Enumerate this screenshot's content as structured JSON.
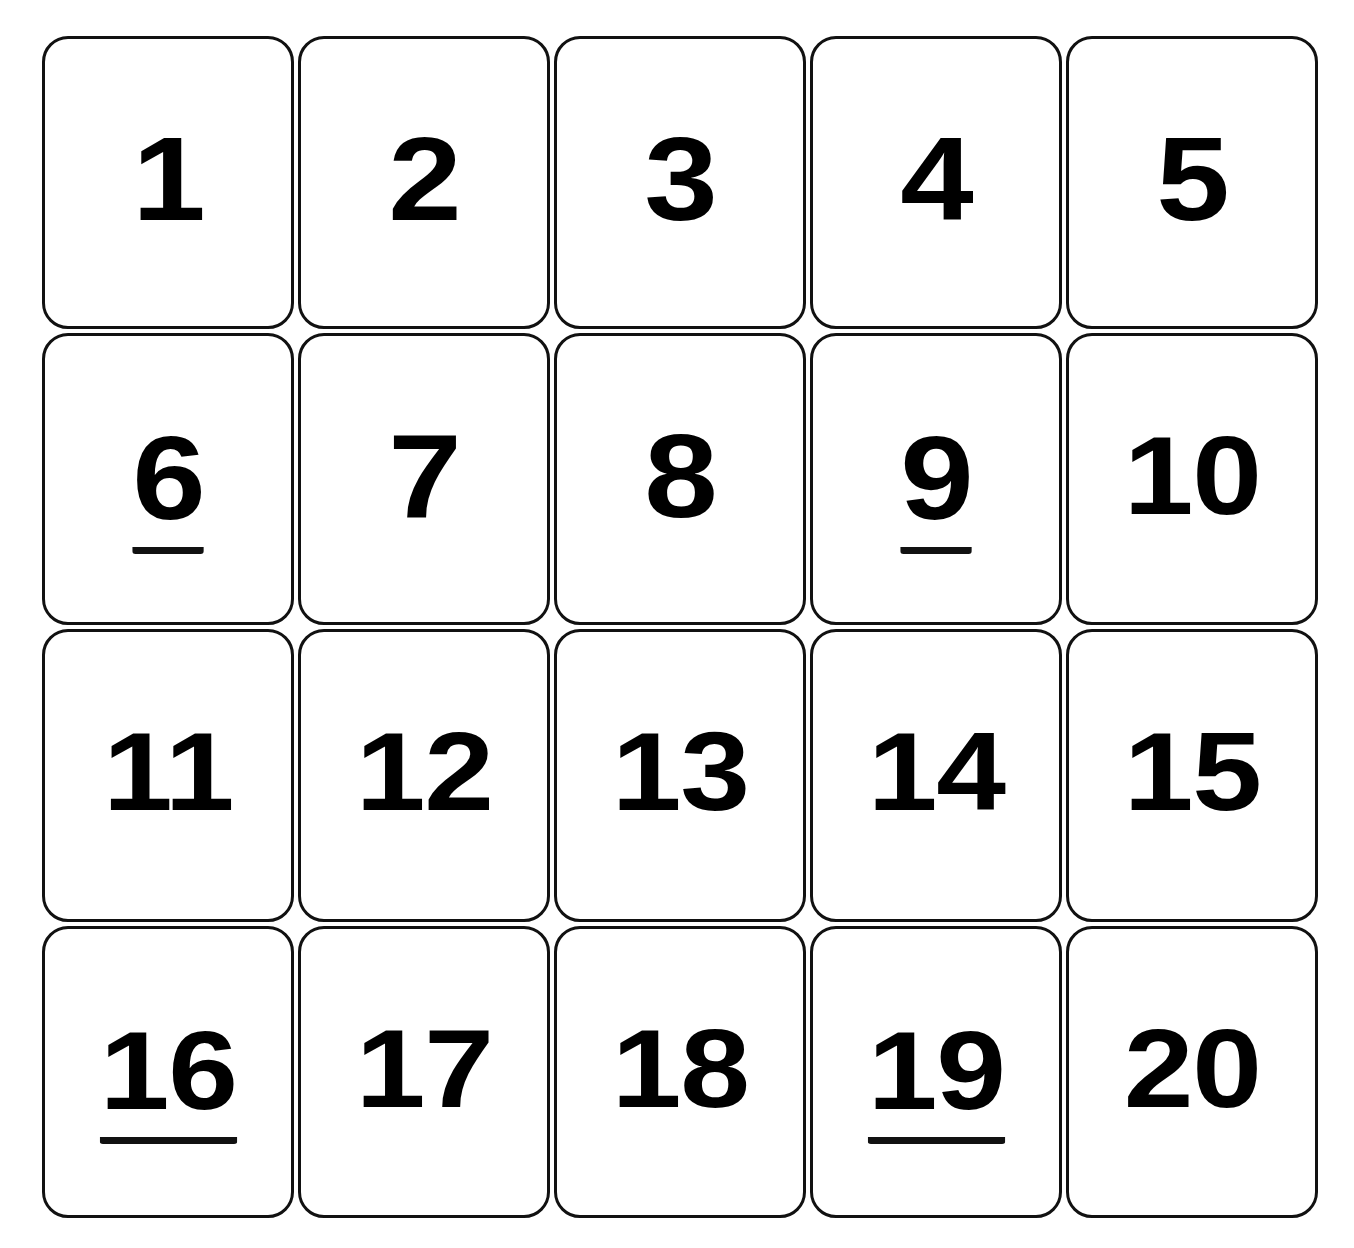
{
  "cards": [
    {
      "label": "1",
      "underlined": false
    },
    {
      "label": "2",
      "underlined": false
    },
    {
      "label": "3",
      "underlined": false
    },
    {
      "label": "4",
      "underlined": false
    },
    {
      "label": "5",
      "underlined": false
    },
    {
      "label": "6",
      "underlined": true
    },
    {
      "label": "7",
      "underlined": false
    },
    {
      "label": "8",
      "underlined": false
    },
    {
      "label": "9",
      "underlined": true
    },
    {
      "label": "10",
      "underlined": false
    },
    {
      "label": "11",
      "underlined": false
    },
    {
      "label": "12",
      "underlined": false
    },
    {
      "label": "13",
      "underlined": false
    },
    {
      "label": "14",
      "underlined": false
    },
    {
      "label": "15",
      "underlined": false
    },
    {
      "label": "16",
      "underlined": true
    },
    {
      "label": "17",
      "underlined": false
    },
    {
      "label": "18",
      "underlined": false
    },
    {
      "label": "19",
      "underlined": true
    },
    {
      "label": "20",
      "underlined": false
    }
  ],
  "colors": {
    "border": "#111111",
    "text": "#000000",
    "background": "#ffffff"
  }
}
